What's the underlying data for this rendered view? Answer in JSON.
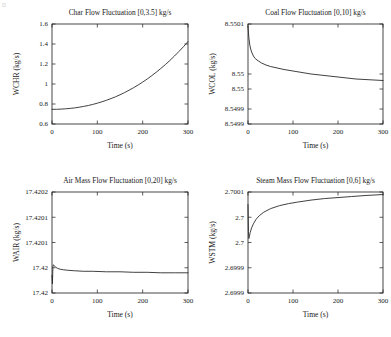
{
  "figure": {
    "corner_artifact": "¤",
    "background": "#ffffff",
    "line_color": "#2b2b2b",
    "axis_color": "#1a1a1a"
  },
  "chart_data": [
    {
      "type": "line",
      "panel": "top-left",
      "title": "Char Flow Fluctuation [0,3.5] kg/s",
      "xlabel": "Time (s)",
      "ylabel": "WCHR (kg/s)",
      "xlim": [
        0,
        300
      ],
      "ylim": [
        0.6,
        1.6
      ],
      "xticks": [
        0,
        100,
        200,
        300
      ],
      "xticklabels": [
        "0",
        "100",
        "200",
        "300"
      ],
      "yticks": [
        0.6,
        0.8,
        1.0,
        1.2,
        1.4,
        1.6
      ],
      "yticklabels": [
        "0.6",
        "0.8",
        "1",
        "1.2",
        "1.4",
        "1.6"
      ],
      "grid": false,
      "legend": null,
      "x": [
        0,
        10,
        20,
        30,
        40,
        50,
        60,
        70,
        80,
        90,
        100,
        110,
        120,
        130,
        140,
        150,
        160,
        170,
        180,
        190,
        200,
        210,
        220,
        230,
        240,
        250,
        260,
        270,
        280,
        290,
        300
      ],
      "y": [
        0.747,
        0.747,
        0.749,
        0.752,
        0.756,
        0.761,
        0.768,
        0.776,
        0.785,
        0.796,
        0.808,
        0.822,
        0.837,
        0.854,
        0.872,
        0.892,
        0.914,
        0.938,
        0.963,
        0.99,
        1.019,
        1.05,
        1.083,
        1.118,
        1.155,
        1.194,
        1.235,
        1.279,
        1.325,
        1.373,
        1.424
      ]
    },
    {
      "type": "line",
      "panel": "top-right",
      "title": "Coal Flow Fluctuation [0,10] kg/s",
      "xlabel": "Time (s)",
      "ylabel": "WCOL (kg/s)",
      "xlim": [
        0,
        300
      ],
      "ylim": [
        8.5499,
        8.5501
      ],
      "xticks": [
        0,
        100,
        200,
        300
      ],
      "xticklabels": [
        "0",
        "100",
        "200",
        "300"
      ],
      "yticks": [
        8.5499,
        8.54993,
        8.54997,
        8.55,
        8.5501
      ],
      "yticklabels": [
        "8.5499",
        "8.5499",
        "8.55",
        "8.55",
        "8.5501"
      ],
      "grid": false,
      "legend": null,
      "x": [
        0,
        2,
        4,
        6,
        8,
        12,
        16,
        20,
        30,
        40,
        50,
        60,
        80,
        100,
        120,
        140,
        160,
        180,
        200,
        220,
        240,
        260,
        280,
        300
      ],
      "y": [
        8.550095,
        8.550072,
        8.550058,
        8.55005,
        8.550044,
        8.550036,
        8.550031,
        8.550028,
        8.550022,
        8.550018,
        8.550015,
        8.550013,
        8.550009,
        8.550006,
        8.550003,
        8.55,
        8.549998,
        8.549996,
        8.549994,
        8.549992,
        8.54999,
        8.549989,
        8.549988,
        8.549987
      ]
    },
    {
      "type": "line",
      "panel": "bottom-left",
      "title": "Air Mass Flow Fluctuation [0,20] kg/s",
      "xlabel": "Time (s)",
      "ylabel": "WAIR (kg/s)",
      "xlim": [
        0,
        300
      ],
      "ylim": [
        17.42,
        17.4202
      ],
      "xticks": [
        0,
        100,
        200,
        300
      ],
      "xticklabels": [
        "0",
        "100",
        "200",
        "300"
      ],
      "yticks": [
        17.42,
        17.42005,
        17.4201,
        17.42015,
        17.4202
      ],
      "yticklabels": [
        "17.42",
        "17.42",
        "17.4201",
        "17.4201",
        "17.4202"
      ],
      "grid": false,
      "legend": null,
      "x": [
        0,
        1,
        2,
        3,
        5,
        8,
        12,
        18,
        25,
        35,
        50,
        70,
        90,
        120,
        150,
        180,
        210,
        240,
        270,
        300
      ],
      "y": [
        17.420035,
        17.420018,
        17.420052,
        17.420056,
        17.420054,
        17.420051,
        17.420049,
        17.420047,
        17.420046,
        17.420045,
        17.420044,
        17.420043,
        17.420043,
        17.420042,
        17.420042,
        17.420041,
        17.420041,
        17.42004,
        17.42004,
        17.42004
      ]
    },
    {
      "type": "line",
      "panel": "bottom-right",
      "title": "Steam Mass Flow Fluctuation [0,6] kg/s",
      "xlabel": "Time (s)",
      "ylabel": "WSTM (kg/s)",
      "xlim": [
        0,
        300
      ],
      "ylim": [
        2.6999,
        2.7001
      ],
      "xticks": [
        0,
        100,
        200,
        300
      ],
      "xticklabels": [
        "0",
        "100",
        "200",
        "300"
      ],
      "yticks": [
        2.6999,
        2.69995,
        2.7,
        2.70005,
        2.7001
      ],
      "yticklabels": [
        "2.6999",
        "2.6999",
        "2.7",
        "2.7",
        "2.7001"
      ],
      "grid": false,
      "legend": null,
      "x": [
        0,
        1,
        2,
        3,
        5,
        8,
        12,
        18,
        25,
        35,
        50,
        70,
        90,
        110,
        140,
        170,
        200,
        230,
        260,
        300
      ],
      "y": [
        2.700075,
        2.700022,
        2.700008,
        2.700012,
        2.70002,
        2.700029,
        2.700037,
        2.700046,
        2.700053,
        2.70006,
        2.700067,
        2.700073,
        2.700077,
        2.70008,
        2.700084,
        2.700087,
        2.700089,
        2.700091,
        2.700093,
        2.700095
      ]
    }
  ]
}
